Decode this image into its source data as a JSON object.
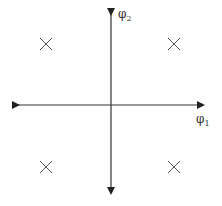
{
  "diagram": {
    "type": "constellation",
    "axes": {
      "horizontal": {
        "label": "φ",
        "subscript": "1"
      },
      "vertical": {
        "label": "φ",
        "subscript": "2"
      }
    },
    "points": [
      {
        "quadrant": "top-left",
        "marker": "x"
      },
      {
        "quadrant": "top-right",
        "marker": "x"
      },
      {
        "quadrant": "bottom-left",
        "marker": "x"
      },
      {
        "quadrant": "bottom-right",
        "marker": "x"
      }
    ],
    "colors": {
      "axis": "#222222",
      "marker": "#555555"
    }
  }
}
